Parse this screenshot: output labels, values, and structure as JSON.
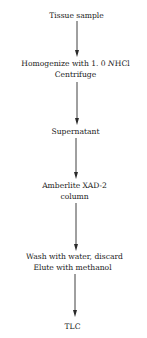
{
  "diagram": {
    "type": "flowchart",
    "direction": "top-to-bottom",
    "nodes": [
      {
        "id": "n1",
        "lines": [
          "Tissue sample"
        ]
      },
      {
        "id": "n2",
        "lines": [
          "Homogenize with 1.0 N HCl",
          "Centrifuge"
        ],
        "line1_parts": {
          "pre": "Homogenize with 1. 0 ",
          "italic": "N",
          "post": "HCl"
        }
      },
      {
        "id": "n3",
        "lines": [
          "Supernatant"
        ]
      },
      {
        "id": "n4",
        "lines": [
          "Amberlite XAD-2",
          "column"
        ]
      },
      {
        "id": "n5",
        "lines": [
          "Wash with water, discard",
          "Elute with methanol"
        ]
      },
      {
        "id": "n6",
        "lines": [
          "TLC"
        ]
      }
    ],
    "edges": [
      {
        "from": "n1",
        "to": "n2"
      },
      {
        "from": "n2",
        "to": "n3"
      },
      {
        "from": "n3",
        "to": "n4"
      },
      {
        "from": "n4",
        "to": "n5"
      },
      {
        "from": "n5",
        "to": "n6"
      }
    ],
    "colors": {
      "line": "#2a2a2a",
      "text": "#1a1a1a",
      "background": "#ffffff"
    }
  }
}
